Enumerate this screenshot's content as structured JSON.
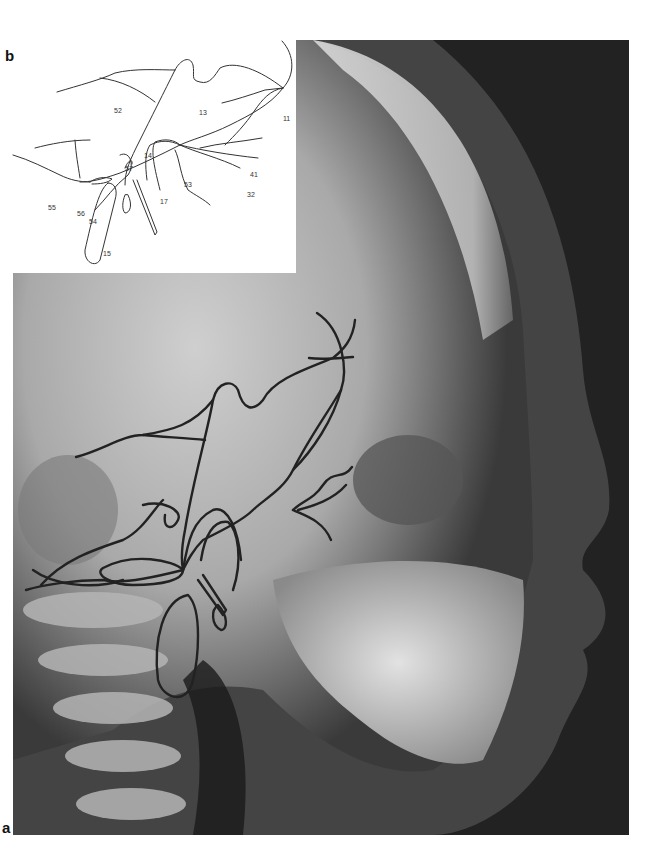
{
  "figure": {
    "panels": {
      "a": {
        "label": "a",
        "description": "Lateral cephalometric radiograph with tracing overlay"
      },
      "b": {
        "label": "b",
        "description": "Line tracing of cranial base structures"
      }
    },
    "tracing_labels": [
      {
        "id": "52",
        "x": 119,
        "y": 71
      },
      {
        "id": "13",
        "x": 200,
        "y": 73
      },
      {
        "id": "11",
        "x": 283,
        "y": 79
      },
      {
        "id": "14",
        "x": 145,
        "y": 118
      },
      {
        "id": "57",
        "x": 126,
        "y": 131
      },
      {
        "id": "41",
        "x": 250,
        "y": 137
      },
      {
        "id": "53",
        "x": 184,
        "y": 147
      },
      {
        "id": "32",
        "x": 247,
        "y": 156
      },
      {
        "id": "55",
        "x": 48,
        "y": 169
      },
      {
        "id": "56",
        "x": 77,
        "y": 175
      },
      {
        "id": "54",
        "x": 89,
        "y": 183
      },
      {
        "id": "17",
        "x": 160,
        "y": 163
      },
      {
        "id": "15",
        "x": 103,
        "y": 216
      },
      {
        "id": "58",
        "x": 156,
        "y": 238
      }
    ],
    "colors": {
      "tracing_line": "#222222",
      "background": "#ffffff"
    }
  }
}
